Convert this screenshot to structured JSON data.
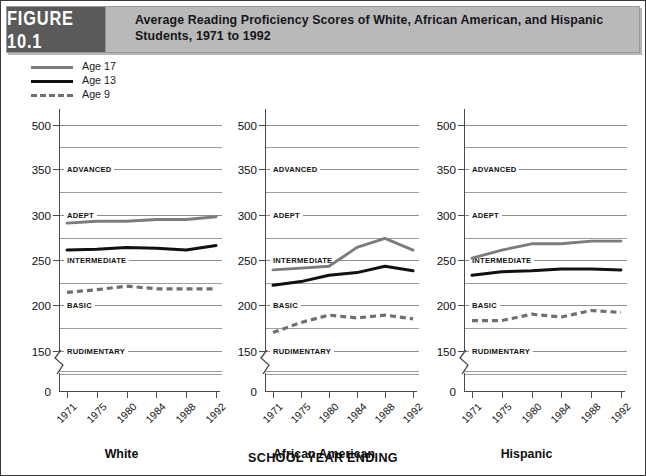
{
  "figure": {
    "tag": "FIGURE 10.1",
    "title": "Average Reading Proficiency Scores of White, African American, and Hispanic Students, 1971 to 1992"
  },
  "legend": {
    "position": "top-left",
    "items": [
      {
        "label": "Age 17",
        "color": "#7c7c7c",
        "style": "solid"
      },
      {
        "label": "Age 13",
        "color": "#111111",
        "style": "solid"
      },
      {
        "label": "Age 9",
        "color": "#6f6f6f",
        "style": "dashed"
      }
    ]
  },
  "axis_title": "SCHOOL YEAR ENDING",
  "chart_data": {
    "type": "line",
    "title": "Average Reading Proficiency Scores of White, African American, and Hispanic Students, 1971 to 1992",
    "xlabel": "SCHOOL YEAR ENDING",
    "ylabel": "",
    "x": [
      1971,
      1975,
      1980,
      1984,
      1988,
      1992
    ],
    "xticklabels": [
      "1971",
      "1975",
      "1980",
      "1984",
      "1988",
      "1992"
    ],
    "yticks": [
      150,
      200,
      250,
      300,
      350,
      500
    ],
    "yticklabels": [
      "150",
      "200",
      "250",
      "300",
      "350",
      "500"
    ],
    "ylim": [
      140,
      510
    ],
    "zero_label": "0",
    "grid": true,
    "legend_position": "above-plot-left",
    "proficiency_bands": [
      {
        "label": "RUDIMENTARY",
        "value": 150
      },
      {
        "label": "BASIC",
        "value": 200
      },
      {
        "label": "INTERMEDIATE",
        "value": 250
      },
      {
        "label": "ADEPT",
        "value": 300
      },
      {
        "label": "ADVANCED",
        "value": 350
      }
    ],
    "panels": [
      {
        "name": "White",
        "series": [
          {
            "name": "Age 17",
            "color": "#7c7c7c",
            "style": "solid",
            "values": [
              291,
              293,
              293,
              295,
              295,
              298
            ]
          },
          {
            "name": "Age 13",
            "color": "#111111",
            "style": "solid",
            "values": [
              261,
              262,
              264,
              263,
              261,
              266
            ]
          },
          {
            "name": "Age 9",
            "color": "#6f6f6f",
            "style": "dashed",
            "values": [
              214,
              217,
              221,
              218,
              218,
              218
            ]
          }
        ]
      },
      {
        "name": "African American",
        "series": [
          {
            "name": "Age 17",
            "color": "#7c7c7c",
            "style": "solid",
            "values": [
              239,
              241,
              243,
              264,
              274,
              261
            ]
          },
          {
            "name": "Age 13",
            "color": "#111111",
            "style": "solid",
            "values": [
              222,
              226,
              233,
              236,
              243,
              238
            ]
          },
          {
            "name": "Age 9",
            "color": "#6f6f6f",
            "style": "dashed",
            "values": [
              170,
              181,
              189,
              186,
              189,
              185
            ]
          }
        ]
      },
      {
        "name": "Hispanic",
        "series": [
          {
            "name": "Age 17",
            "color": "#7c7c7c",
            "style": "solid",
            "values": [
              252,
              261,
              268,
              268,
              271,
              271
            ]
          },
          {
            "name": "Age 13",
            "color": "#111111",
            "style": "solid",
            "values": [
              233,
              237,
              238,
              240,
              240,
              239
            ]
          },
          {
            "name": "Age 9",
            "color": "#6f6f6f",
            "style": "dashed",
            "values": [
              183,
              183,
              190,
              187,
              194,
              192
            ]
          }
        ]
      }
    ]
  }
}
